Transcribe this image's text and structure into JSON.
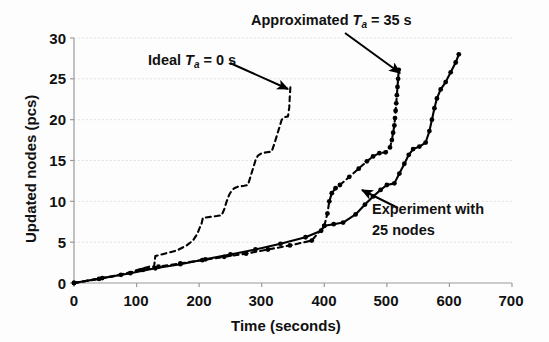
{
  "chart_data": {
    "type": "line",
    "title": "",
    "xlabel": "Time (seconds)",
    "ylabel": "Updated nodes (pcs)",
    "xlim": [
      0,
      700
    ],
    "ylim": [
      0,
      30
    ],
    "xticks": [
      0,
      100,
      200,
      300,
      400,
      500,
      600,
      700
    ],
    "yticks": [
      0,
      5,
      10,
      15,
      20,
      25,
      30
    ],
    "grid": "horizontal-dotted",
    "legend_position": "inline-annotations",
    "annotations": [
      {
        "id": "ideal",
        "text_prefix": "Ideal ",
        "symbol": "T",
        "symbol_sub": "a",
        "text_suffix": " = 0 s",
        "arrow_from": [
          230,
          63
        ],
        "arrow_to": [
          288,
          89
        ]
      },
      {
        "id": "approximated",
        "text_prefix": "Approximated ",
        "symbol": "T",
        "symbol_sub": "a",
        "text_suffix": " = 35 s",
        "arrow_from": [
          345,
          33
        ],
        "arrow_to": [
          400,
          73
        ]
      },
      {
        "id": "experiment",
        "line1": "Experiment with",
        "line2": "25 nodes",
        "arrow_from": [
          398,
          208
        ],
        "arrow_to": [
          362,
          190
        ]
      }
    ],
    "series": [
      {
        "name": "Ideal Ta = 0 s",
        "style": "dashed",
        "marker": "none",
        "color": "#000000",
        "points": [
          [
            0,
            0
          ],
          [
            30,
            0.4
          ],
          [
            60,
            0.8
          ],
          [
            90,
            1.3
          ],
          [
            110,
            1.8
          ],
          [
            120,
            2.0
          ],
          [
            128,
            2.0
          ],
          [
            130,
            3.3
          ],
          [
            140,
            3.5
          ],
          [
            150,
            3.7
          ],
          [
            165,
            4.0
          ],
          [
            180,
            4.6
          ],
          [
            190,
            5.2
          ],
          [
            197,
            6.0
          ],
          [
            200,
            6.6
          ],
          [
            204,
            7.3
          ],
          [
            206,
            8.0
          ],
          [
            208,
            8.0
          ],
          [
            218,
            8.1
          ],
          [
            228,
            8.2
          ],
          [
            236,
            8.3
          ],
          [
            240,
            9.0
          ],
          [
            244,
            10.0
          ],
          [
            248,
            10.8
          ],
          [
            252,
            11.3
          ],
          [
            256,
            11.6
          ],
          [
            262,
            11.8
          ],
          [
            272,
            11.9
          ],
          [
            278,
            12.0
          ],
          [
            282,
            13.0
          ],
          [
            286,
            14.0
          ],
          [
            290,
            15.0
          ],
          [
            294,
            15.6
          ],
          [
            300,
            15.9
          ],
          [
            308,
            16.0
          ],
          [
            316,
            16.1
          ],
          [
            320,
            17.0
          ],
          [
            324,
            18.0
          ],
          [
            328,
            19.0
          ],
          [
            332,
            20.0
          ],
          [
            336,
            20.3
          ],
          [
            342,
            20.4
          ],
          [
            344,
            21.5
          ],
          [
            345,
            23.0
          ],
          [
            346,
            24.2
          ]
        ]
      },
      {
        "name": "Approximated Ta = 35 s",
        "style": "dashed",
        "marker": "circle",
        "color": "#000000",
        "points": [
          [
            0,
            0
          ],
          [
            40,
            0.5
          ],
          [
            75,
            1.0
          ],
          [
            110,
            1.6
          ],
          [
            135,
            2.0
          ],
          [
            170,
            2.4
          ],
          [
            205,
            2.8
          ],
          [
            240,
            3.2
          ],
          [
            275,
            3.6
          ],
          [
            310,
            4.1
          ],
          [
            345,
            4.6
          ],
          [
            380,
            5.2
          ],
          [
            400,
            7.0
          ],
          [
            405,
            8.5
          ],
          [
            408,
            10.0
          ],
          [
            412,
            11.0
          ],
          [
            418,
            11.6
          ],
          [
            425,
            12.0
          ],
          [
            440,
            13.0
          ],
          [
            455,
            14.0
          ],
          [
            468,
            14.9
          ],
          [
            478,
            15.5
          ],
          [
            488,
            15.9
          ],
          [
            498,
            16.0
          ],
          [
            505,
            16.6
          ],
          [
            508,
            17.5
          ],
          [
            510,
            18.4
          ],
          [
            512,
            19.3
          ],
          [
            513,
            20.2
          ],
          [
            514,
            21.1
          ],
          [
            515,
            22.0
          ],
          [
            516,
            23.0
          ],
          [
            517,
            24.0
          ],
          [
            518,
            25.0
          ],
          [
            519,
            26.1
          ]
        ]
      },
      {
        "name": "Experiment with 25 nodes",
        "style": "solid",
        "marker": "circle",
        "color": "#000000",
        "points": [
          [
            0,
            0
          ],
          [
            45,
            0.6
          ],
          [
            90,
            1.2
          ],
          [
            130,
            1.8
          ],
          [
            170,
            2.3
          ],
          [
            210,
            2.9
          ],
          [
            250,
            3.5
          ],
          [
            290,
            4.1
          ],
          [
            330,
            4.8
          ],
          [
            370,
            5.6
          ],
          [
            395,
            6.4
          ],
          [
            400,
            7.0
          ],
          [
            415,
            7.2
          ],
          [
            430,
            7.4
          ],
          [
            450,
            8.4
          ],
          [
            465,
            9.6
          ],
          [
            478,
            10.6
          ],
          [
            490,
            11.4
          ],
          [
            500,
            12.0
          ],
          [
            512,
            12.2
          ],
          [
            520,
            13.4
          ],
          [
            528,
            14.6
          ],
          [
            535,
            15.7
          ],
          [
            542,
            16.4
          ],
          [
            552,
            16.7
          ],
          [
            562,
            17.2
          ],
          [
            568,
            18.6
          ],
          [
            572,
            20.0
          ],
          [
            576,
            21.4
          ],
          [
            580,
            22.6
          ],
          [
            586,
            23.7
          ],
          [
            594,
            24.6
          ],
          [
            602,
            25.8
          ],
          [
            610,
            27.0
          ],
          [
            615,
            28.0
          ]
        ]
      }
    ]
  }
}
